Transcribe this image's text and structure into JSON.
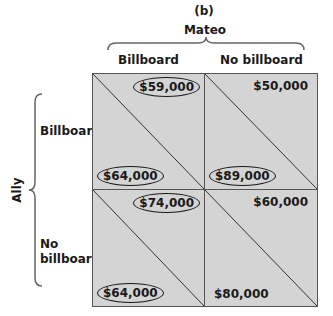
{
  "figure": {
    "panel_label": "(b)",
    "column_player": "Mateo",
    "row_player": "Ally",
    "columns": [
      "Billboard",
      "No billboard"
    ],
    "rows": [
      "Billboard",
      "No\nbillboard"
    ],
    "row_labels": {
      "r0": "Billboard",
      "r1_line1": "No",
      "r1_line2": "billboard"
    },
    "cells": [
      {
        "row": "Billboard",
        "col": "Billboard",
        "mateo_payoff": "$59,000",
        "mateo_circled": true,
        "ally_payoff": "$64,000",
        "ally_circled": true
      },
      {
        "row": "Billboard",
        "col": "No billboard",
        "mateo_payoff": "$50,000",
        "mateo_circled": false,
        "ally_payoff": "$89,000",
        "ally_circled": true
      },
      {
        "row": "No billboard",
        "col": "Billboard",
        "mateo_payoff": "$74,000",
        "mateo_circled": true,
        "ally_payoff": "$64,000",
        "ally_circled": true
      },
      {
        "row": "No billboard",
        "col": "No billboard",
        "mateo_payoff": "$60,000",
        "mateo_circled": false,
        "ally_payoff": "$80,000",
        "ally_circled": false
      }
    ],
    "colors": {
      "cell_fill": "#d4d4d4",
      "line": "#555555",
      "text": "#1a1a1a"
    }
  }
}
